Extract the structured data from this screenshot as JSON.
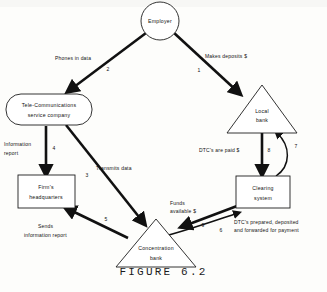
{
  "figure": {
    "caption": "FIGURE 6.2"
  },
  "nodes": [
    {
      "id": "employer",
      "shape": "circle",
      "label_line1": "Employer",
      "label_line2": ""
    },
    {
      "id": "telecom",
      "shape": "rounded-rect",
      "label_line1": "Tele-Communications",
      "label_line2": "service company"
    },
    {
      "id": "local-bank",
      "shape": "triangle",
      "label_line1": "Local",
      "label_line2": "bank"
    },
    {
      "id": "firms-hq",
      "shape": "rect",
      "label_line1": "Firm's",
      "label_line2": "headquarters"
    },
    {
      "id": "clearing-system",
      "shape": "rect",
      "label_line1": "Clearing",
      "label_line2": "system"
    },
    {
      "id": "concentration-bank",
      "shape": "triangle",
      "label_line1": "Concentration",
      "label_line2": "bank"
    }
  ],
  "edges": [
    {
      "number": "1",
      "label_line1": "Makes deposits $",
      "label_line2": "",
      "from": "employer",
      "to": "local-bank"
    },
    {
      "number": "2",
      "label_line1": "Phones in data",
      "label_line2": "",
      "from": "employer",
      "to": "telecom"
    },
    {
      "number": "3",
      "label_line1": "Transmits data",
      "label_line2": "",
      "from": "telecom",
      "to": "concentration-bank"
    },
    {
      "number": "4",
      "label_line1": "Information",
      "label_line2": "report",
      "from": "telecom",
      "to": "firms-hq"
    },
    {
      "number": "5",
      "label_line1": "Sends",
      "label_line2": "information report",
      "from": "concentration-bank",
      "to": "firms-hq"
    },
    {
      "number": "6",
      "label_line1": "DTC's prepared, deposited",
      "label_line2": "and forwarded for payment",
      "from": "concentration-bank",
      "to": "clearing-system"
    },
    {
      "number": "7",
      "label_line1": "",
      "label_line2": "",
      "from": "clearing-system",
      "to": "local-bank"
    },
    {
      "number": "8",
      "label_line1": "DTC's are paid $",
      "label_line2": "",
      "from": "local-bank",
      "to": "clearing-system"
    },
    {
      "number": "9",
      "label_line1": "Funds",
      "label_line2": "available $",
      "from": "clearing-system",
      "to": "concentration-bank"
    }
  ],
  "colors": {
    "ink": "#111111",
    "paper": "#fdfdfb",
    "shape_fill": "#ffffff"
  }
}
